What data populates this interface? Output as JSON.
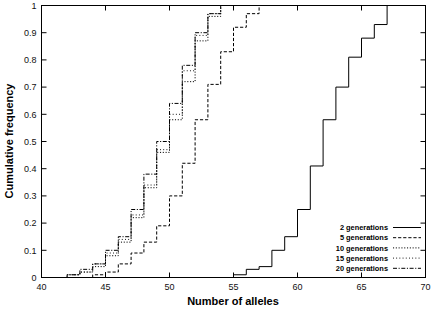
{
  "chart_data": {
    "type": "line",
    "subtype": "step-ecdf",
    "title": "",
    "xlabel": "Number of alleles",
    "ylabel": "Cumulative frequency",
    "xlim": [
      40,
      70
    ],
    "ylim": [
      0,
      1
    ],
    "xticks": [
      40,
      45,
      50,
      55,
      60,
      65,
      70
    ],
    "xtick_labels": [
      "40",
      "45",
      "50",
      "55",
      "60",
      "65",
      "70"
    ],
    "yticks": [
      0,
      0.1,
      0.2,
      0.3,
      0.4,
      0.5,
      0.6,
      0.7,
      0.8,
      0.9,
      1
    ],
    "ytick_labels": [
      "0",
      "0.1",
      "0.2",
      "0.3",
      "0.4",
      "0.5",
      "0.6",
      "0.7",
      "0.8",
      "0.9",
      "1"
    ],
    "grid": false,
    "legend_position": "lower right",
    "series": [
      {
        "name": "2 generations",
        "style": "solid",
        "color": "#000000",
        "x": [
          40,
          54,
          55,
          56,
          57,
          58,
          59,
          60,
          61,
          62,
          63,
          64,
          65,
          66,
          67,
          70
        ],
        "y": [
          0,
          0,
          0.01,
          0.03,
          0.04,
          0.1,
          0.15,
          0.25,
          0.41,
          0.58,
          0.7,
          0.81,
          0.88,
          0.93,
          1.0,
          1.0
        ]
      },
      {
        "name": "5 generations",
        "style": "dashed",
        "color": "#000000",
        "x": [
          40,
          43,
          44,
          45,
          46,
          47,
          48,
          49,
          50,
          51,
          52,
          53,
          54,
          55,
          56,
          57,
          70
        ],
        "y": [
          0,
          0,
          0.01,
          0.02,
          0.05,
          0.09,
          0.13,
          0.19,
          0.3,
          0.42,
          0.58,
          0.71,
          0.83,
          0.92,
          0.97,
          1.0,
          1.0
        ]
      },
      {
        "name": "10 generations",
        "style": "dotted",
        "color": "#000000",
        "x": [
          40,
          41,
          42,
          43,
          44,
          45,
          46,
          47,
          48,
          49,
          50,
          51,
          52,
          53,
          54,
          70
        ],
        "y": [
          0,
          0,
          0.01,
          0.02,
          0.04,
          0.08,
          0.13,
          0.22,
          0.33,
          0.46,
          0.58,
          0.72,
          0.87,
          0.96,
          1.0,
          1.0
        ]
      },
      {
        "name": "15 generations",
        "style": "fine-dotted",
        "color": "#000000",
        "x": [
          40,
          41,
          42,
          43,
          44,
          45,
          46,
          47,
          48,
          49,
          50,
          51,
          52,
          53,
          54,
          70
        ],
        "y": [
          0,
          0,
          0.01,
          0.02,
          0.05,
          0.09,
          0.14,
          0.23,
          0.34,
          0.47,
          0.6,
          0.76,
          0.89,
          0.97,
          1.0,
          1.0
        ]
      },
      {
        "name": "20 generations",
        "style": "dash-dot",
        "color": "#000000",
        "x": [
          40,
          41,
          42,
          43,
          44,
          45,
          46,
          47,
          48,
          49,
          50,
          51,
          52,
          53,
          54,
          70
        ],
        "y": [
          0,
          0,
          0.01,
          0.03,
          0.05,
          0.1,
          0.15,
          0.25,
          0.38,
          0.5,
          0.64,
          0.78,
          0.9,
          0.97,
          1.0,
          1.0
        ]
      }
    ],
    "legend": [
      {
        "label": "2 generations",
        "style": "solid"
      },
      {
        "label": "5 generations",
        "style": "dashed"
      },
      {
        "label": "10 generations",
        "style": "dotted"
      },
      {
        "label": "15 generations",
        "style": "fine-dotted"
      },
      {
        "label": "20 generations",
        "style": "dash-dot"
      }
    ]
  }
}
